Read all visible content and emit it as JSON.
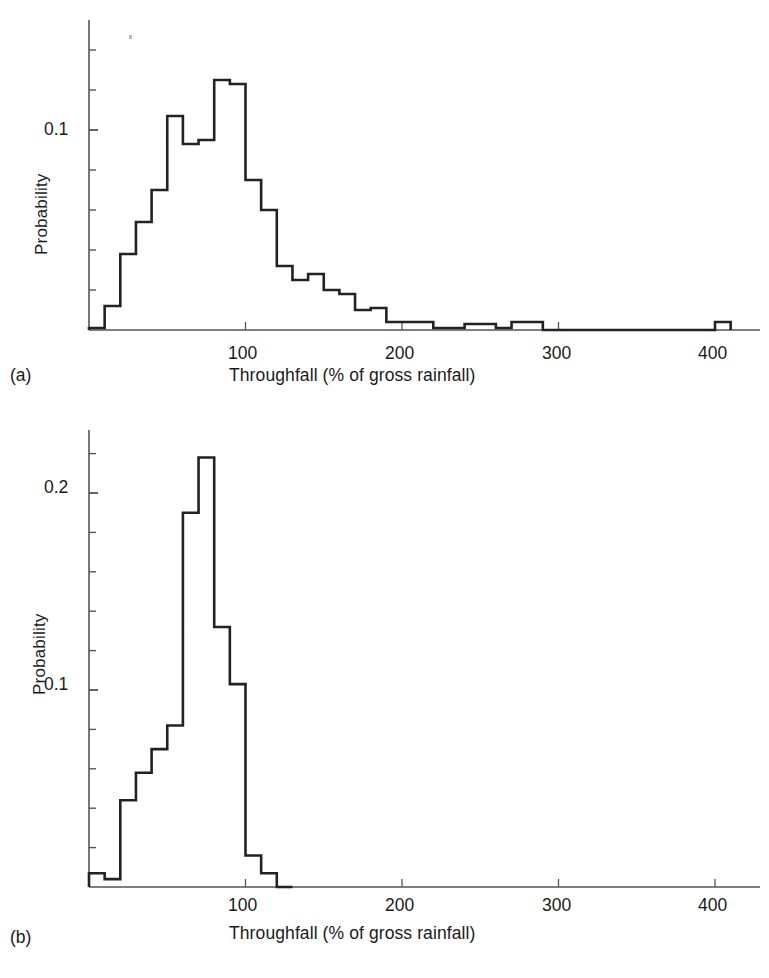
{
  "figure": {
    "background": "#ffffff",
    "ink_color": "#222222",
    "axis_color": "#555555"
  },
  "panels": [
    {
      "tag": "(a)",
      "ylabel": "Probability",
      "xlabel": "Throughfall (% of gross rainfall)",
      "y_ticks_labeled": [
        "0.1"
      ],
      "x_ticks_labeled": [
        "100",
        "200",
        "300",
        "400"
      ]
    },
    {
      "tag": "(b)",
      "ylabel": "Probability",
      "xlabel": "Throughfall (% of gross rainfall)",
      "y_ticks_labeled": [
        "0.2",
        "0.1"
      ],
      "x_ticks_labeled": [
        "100",
        "200",
        "300",
        "400"
      ]
    }
  ],
  "chart_data": [
    {
      "type": "bar",
      "subplot": "a",
      "title": "",
      "xlabel": "Throughfall (% of gross rainfall)",
      "ylabel": "Probability",
      "xlim": [
        0,
        420
      ],
      "ylim": [
        0,
        0.155
      ],
      "grid": false,
      "legend": null,
      "bin_width": 10,
      "bin_edges": [
        0,
        10,
        20,
        30,
        40,
        50,
        60,
        70,
        80,
        90,
        100,
        110,
        120,
        130,
        140,
        150,
        160,
        170,
        180,
        190,
        200,
        210,
        220,
        230,
        240,
        250,
        260,
        270,
        280,
        290,
        300,
        310,
        320,
        330,
        340,
        350,
        360,
        370,
        380,
        390,
        400,
        410
      ],
      "categories": [
        "0-10",
        "10-20",
        "20-30",
        "30-40",
        "40-50",
        "50-60",
        "60-70",
        "70-80",
        "80-90",
        "90-100",
        "100-110",
        "110-120",
        "120-130",
        "130-140",
        "140-150",
        "150-160",
        "160-170",
        "170-180",
        "180-190",
        "190-200",
        "200-210",
        "210-220",
        "220-230",
        "230-240",
        "240-250",
        "250-260",
        "260-270",
        "270-280",
        "280-290",
        "290-300",
        "300-310",
        "310-320",
        "320-330",
        "330-340",
        "340-350",
        "350-360",
        "360-370",
        "370-380",
        "380-390",
        "390-400",
        "400-410"
      ],
      "values": [
        0.001,
        0.012,
        0.038,
        0.054,
        0.07,
        0.107,
        0.093,
        0.095,
        0.125,
        0.123,
        0.075,
        0.06,
        0.032,
        0.025,
        0.028,
        0.02,
        0.018,
        0.01,
        0.011,
        0.004,
        0.004,
        0.004,
        0.001,
        0.001,
        0.003,
        0.003,
        0.001,
        0.004,
        0.004,
        0.0,
        0.0,
        0.0,
        0.0,
        0.0,
        0.0,
        0.0,
        0.0,
        0.0,
        0.0,
        0.0,
        0.004
      ],
      "y_tick_values": [
        0.0,
        0.02,
        0.04,
        0.06,
        0.08,
        0.1,
        0.12,
        0.14
      ],
      "y_tick_labels_shown": {
        "0.1": 0.1
      },
      "x_tick_values": [
        100,
        200,
        300,
        400
      ]
    },
    {
      "type": "bar",
      "subplot": "b",
      "title": "",
      "xlabel": "Throughfall (% of gross rainfall)",
      "ylabel": "Probability",
      "xlim": [
        0,
        420
      ],
      "ylim": [
        0,
        0.235
      ],
      "grid": false,
      "legend": null,
      "bin_width": 10,
      "bin_edges": [
        0,
        10,
        20,
        30,
        40,
        50,
        60,
        70,
        80,
        90,
        100,
        110,
        120,
        130
      ],
      "categories": [
        "0-10",
        "10-20",
        "20-30",
        "30-40",
        "40-50",
        "50-60",
        "60-70",
        "70-80",
        "80-90",
        "90-100",
        "100-110",
        "110-120",
        "120-130"
      ],
      "values": [
        0.007,
        0.004,
        0.044,
        0.058,
        0.07,
        0.082,
        0.19,
        0.218,
        0.132,
        0.103,
        0.016,
        0.007,
        0.0
      ],
      "y_tick_values": [
        0.0,
        0.02,
        0.04,
        0.06,
        0.08,
        0.1,
        0.12,
        0.14,
        0.16,
        0.18,
        0.2,
        0.22
      ],
      "y_tick_labels_shown": {
        "0.2": 0.2,
        "0.1": 0.1
      },
      "x_tick_values": [
        100,
        200,
        300,
        400
      ]
    }
  ]
}
